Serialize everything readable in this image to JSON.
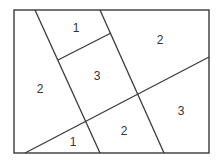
{
  "diagram": {
    "frame": {
      "x": 14,
      "y": 10,
      "width": 195,
      "height": 143
    },
    "lines": [
      {
        "name": "left-diagonal",
        "x1": 35,
        "y1": 10,
        "x2": 100,
        "y2": 153
      },
      {
        "name": "right-diagonal",
        "x1": 100,
        "y1": 10,
        "x2": 164,
        "y2": 153
      },
      {
        "name": "rising-diagonal",
        "x1": 25,
        "y1": 153,
        "x2": 209,
        "y2": 57
      },
      {
        "name": "short-cross-segment",
        "x1": 58,
        "y1": 60,
        "x2": 111,
        "y2": 33
      }
    ],
    "regions": [
      {
        "label": "1",
        "x": 76,
        "y": 29
      },
      {
        "label": "2",
        "x": 160,
        "y": 41
      },
      {
        "label": "2",
        "x": 40,
        "y": 90
      },
      {
        "label": "3",
        "x": 97,
        "y": 77
      },
      {
        "label": "3",
        "x": 181,
        "y": 112
      },
      {
        "label": "2",
        "x": 124,
        "y": 132
      },
      {
        "label": "1",
        "x": 73,
        "y": 143
      }
    ]
  }
}
